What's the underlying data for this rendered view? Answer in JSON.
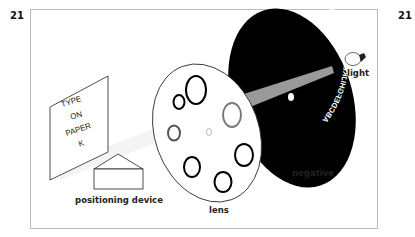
{
  "page_numbers": {
    "left": "21",
    "right": "21"
  },
  "diagram": {
    "title": "",
    "labels": {
      "positioning_device": "positioning device",
      "lens": "lens",
      "negative": "negative",
      "light": "light"
    },
    "paper_card": {
      "lines": [
        "TYPE",
        "ON",
        "PAPER",
        "K"
      ]
    },
    "negative_ring_text": "ABCDEFGHIJKLMNOPQRSTUVWXYZ123456789",
    "colors": {
      "negative_fill": "#000000",
      "beam": "#9a9a9a",
      "frame": "#bdbdbd",
      "ink": "#222222"
    }
  }
}
